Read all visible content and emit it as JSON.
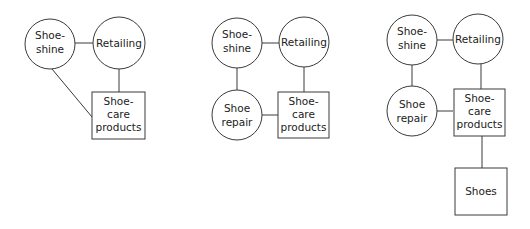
{
  "colors": {
    "stroke": "#3a3a3a",
    "text": "#222222",
    "background": "#ffffff"
  },
  "diagrams": [
    {
      "id": "diagram-1",
      "nodes": [
        {
          "id": "shoeshine",
          "shape": "circle",
          "lines": [
            "Shoe-",
            "shine"
          ]
        },
        {
          "id": "retailing",
          "shape": "circle",
          "lines": [
            "Retailing"
          ]
        },
        {
          "id": "shoecare",
          "shape": "box",
          "lines": [
            "Shoe-",
            "care",
            "products"
          ]
        }
      ],
      "edges": [
        [
          "shoeshine",
          "retailing"
        ],
        [
          "retailing",
          "shoecare"
        ],
        [
          "shoeshine",
          "shoecare"
        ]
      ]
    },
    {
      "id": "diagram-2",
      "nodes": [
        {
          "id": "shoeshine",
          "shape": "circle",
          "lines": [
            "Shoe-",
            "shine"
          ]
        },
        {
          "id": "retailing",
          "shape": "circle",
          "lines": [
            "Retailing"
          ]
        },
        {
          "id": "shoerepair",
          "shape": "circle",
          "lines": [
            "Shoe",
            "repair"
          ]
        },
        {
          "id": "shoecare",
          "shape": "box",
          "lines": [
            "Shoe-",
            "care",
            "products"
          ]
        }
      ],
      "edges": [
        [
          "shoeshine",
          "retailing"
        ],
        [
          "shoeshine",
          "shoerepair"
        ],
        [
          "retailing",
          "shoecare"
        ],
        [
          "shoerepair",
          "shoecare"
        ]
      ]
    },
    {
      "id": "diagram-3",
      "nodes": [
        {
          "id": "shoeshine",
          "shape": "circle",
          "lines": [
            "Shoe-",
            "shine"
          ]
        },
        {
          "id": "retailing",
          "shape": "circle",
          "lines": [
            "Retailing"
          ]
        },
        {
          "id": "shoerepair",
          "shape": "circle",
          "lines": [
            "Shoe",
            "repair"
          ]
        },
        {
          "id": "shoecare",
          "shape": "box",
          "lines": [
            "Shoe-",
            "care",
            "products"
          ]
        },
        {
          "id": "shoes",
          "shape": "box",
          "lines": [
            "Shoes"
          ]
        }
      ],
      "edges": [
        [
          "shoeshine",
          "retailing"
        ],
        [
          "shoeshine",
          "shoerepair"
        ],
        [
          "retailing",
          "shoecare"
        ],
        [
          "shoerepair",
          "shoecare"
        ],
        [
          "shoecare",
          "shoes"
        ]
      ]
    }
  ]
}
